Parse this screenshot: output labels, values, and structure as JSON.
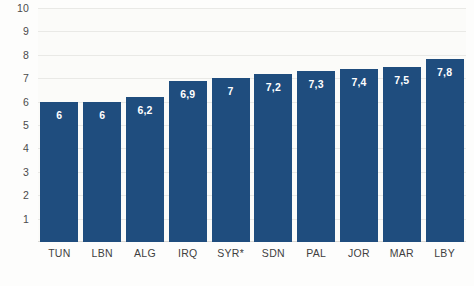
{
  "chart_data": {
    "type": "bar",
    "title": "",
    "subtitle": "",
    "xlabel": "",
    "ylabel": "",
    "categories": [
      "TUN",
      "LBN",
      "ALG",
      "IRQ",
      "SYR*",
      "SDN",
      "PAL",
      "JOR",
      "MAR",
      "LBY"
    ],
    "values": [
      6,
      6,
      6.2,
      6.9,
      7,
      7.2,
      7.3,
      7.4,
      7.5,
      7.8
    ],
    "value_labels": [
      "6",
      "6",
      "6,2",
      "6,9",
      "7",
      "7,2",
      "7,3",
      "7,4",
      "7,5",
      "7,8"
    ],
    "ylim": [
      0,
      10
    ],
    "y_ticks": [
      1,
      2,
      3,
      4,
      5,
      6,
      7,
      8,
      9,
      10
    ],
    "y_tick_labels": [
      "1",
      "2",
      "3",
      "4",
      "5",
      "6",
      "7",
      "8",
      "9",
      "10"
    ],
    "grid": true,
    "legend": null,
    "legend_position": "none",
    "annotations": [
      "*"
    ],
    "bar_color": "#1f4d7e",
    "label_color": "#ffffff",
    "grid_color": "#e9e9e6",
    "background_color": "#fbfbf9"
  }
}
